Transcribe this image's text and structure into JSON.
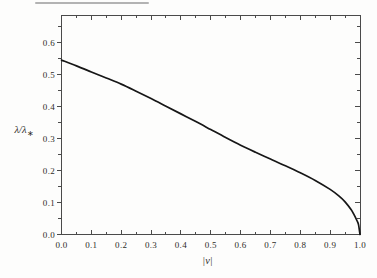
{
  "figure": {
    "y_axis_label": {
      "main": "λ/λ",
      "sub": "∗"
    },
    "x_axis_label": "|ν|"
  },
  "colors": {
    "background": "#fdfdfc",
    "frame": "#4a4a4a",
    "curve": "#161616",
    "text": "#2e2c28",
    "scan_artifact": "#a6a6a6"
  },
  "chart_data": {
    "type": "line",
    "title": "",
    "xlabel": "|ν|",
    "ylabel": "λ/λ∗",
    "xlim": [
      0,
      1.0
    ],
    "ylim": [
      0,
      0.686
    ],
    "grid": false,
    "legend": "none",
    "x_major_ticks": [
      0.0,
      0.1,
      0.2,
      0.3,
      0.4,
      0.5,
      0.6,
      0.7,
      0.8,
      0.9,
      1.0
    ],
    "x_tick_labels": [
      "0.0",
      "0.1",
      "0.2",
      "0.3",
      "0.4",
      "0.5",
      "0.6",
      "0.7",
      "0.8",
      "0.9",
      "1.0"
    ],
    "x_minor_ticks": [
      0.05,
      0.15,
      0.25,
      0.35,
      0.45,
      0.55,
      0.65,
      0.75,
      0.85,
      0.95
    ],
    "y_major_ticks": [
      0.0,
      0.1,
      0.2,
      0.3,
      0.4,
      0.5,
      0.6
    ],
    "y_tick_labels": [
      "0.0",
      "0.1",
      "0.2",
      "0.3",
      "0.4",
      "0.5",
      "0.6"
    ],
    "y_minor_ticks": [
      0.05,
      0.15,
      0.25,
      0.35,
      0.45,
      0.55,
      0.65
    ],
    "series": [
      {
        "name": "lambda-ratio-vs-nu",
        "x": [
          0,
          0.05,
          0.1,
          0.15,
          0.2,
          0.25,
          0.3,
          0.35,
          0.4,
          0.45,
          0.5,
          0.55,
          0.6,
          0.65,
          0.7,
          0.75,
          0.8,
          0.85,
          0.9,
          0.93,
          0.95,
          0.97,
          0.98,
          0.99,
          0.995,
          1.0
        ],
        "y": [
          0.545,
          0.527,
          0.508,
          0.489,
          0.47,
          0.448,
          0.425,
          0.401,
          0.377,
          0.353,
          0.328,
          0.303,
          0.279,
          0.257,
          0.236,
          0.215,
          0.193,
          0.169,
          0.141,
          0.12,
          0.102,
          0.078,
          0.062,
          0.043,
          0.031,
          0.0
        ]
      }
    ]
  }
}
